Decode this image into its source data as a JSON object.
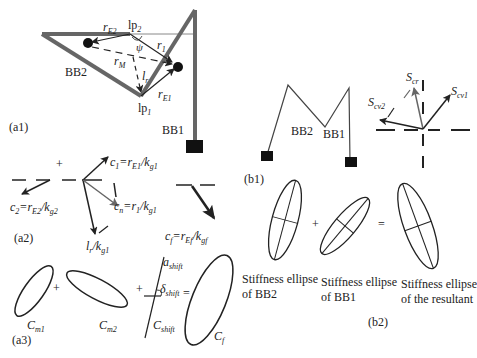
{
  "panels": {
    "a1": {
      "label": "(a1)",
      "bb1": "BB1",
      "bb2": "BB2",
      "r_E2": {
        "main": "r",
        "sub": "E2"
      },
      "lp2": {
        "main": "lp",
        "sub": "2"
      },
      "r1": {
        "main": "r",
        "sub": "1"
      },
      "psi": "ψ",
      "r_M": {
        "main": "r",
        "sub": "M"
      },
      "l_r": {
        "main": "l",
        "sub": "r"
      },
      "r_E1": {
        "main": "r",
        "sub": "E1"
      },
      "lp1": {
        "main": "lp",
        "sub": "1"
      }
    },
    "a2": {
      "label": "(a2)",
      "plus": "+",
      "c1": "c₁=r_E1/k_g1",
      "c1_parts": {
        "lhs": "c",
        "lhs_sub": "1",
        "r": "r",
        "r_sub": "E1",
        "k": "k",
        "k_sub": "g1"
      },
      "c2_parts": {
        "lhs": "c",
        "lhs_sub": "2",
        "r": "r",
        "r_sub": "E2",
        "k": "k",
        "k_sub": "g2"
      },
      "cn_parts": {
        "lhs": "c",
        "lhs_sub": "n",
        "r": "r",
        "r_sub": "1",
        "k": "k",
        "k_sub": "g1"
      },
      "cf_parts": {
        "lhs": "c",
        "lhs_sub": "f",
        "r": "r",
        "r_sub": "Ef",
        "k": "k",
        "k_sub": "gf"
      },
      "lr_parts": {
        "l": "l",
        "l_sub": "r",
        "k": "k",
        "k_sub": "g1"
      }
    },
    "a3": {
      "label": "(a3)",
      "plus1": "+",
      "plus2": "+",
      "equals": "=",
      "cm1": {
        "main": "C",
        "sub": "m1"
      },
      "cm2": {
        "main": "C",
        "sub": "m2"
      },
      "cshift": {
        "main": "C",
        "sub": "shift"
      },
      "ashift": {
        "main": "a",
        "sub": "shift"
      },
      "dshift": {
        "main": "δ",
        "sub": "shift"
      },
      "cf": {
        "main": "C",
        "sub": "f"
      }
    },
    "b1": {
      "label": "(b1)",
      "bb2": "BB2",
      "bb1": "BB1",
      "s_cr": {
        "main": "S",
        "sub": "cr"
      },
      "s_cv1": {
        "main": "S",
        "sub": "cv1"
      },
      "s_cv2": {
        "main": "S",
        "sub": "cv2"
      }
    },
    "b2": {
      "label": "(b2)",
      "plus": "+",
      "equals": "=",
      "caption_bb2": [
        "Stiffness ellipse",
        "of BB2"
      ],
      "caption_bb1": [
        "Stiffness ellipse",
        "of BB1"
      ],
      "caption_res": [
        "Stiffness ellipse",
        "of the resultant"
      ]
    }
  }
}
